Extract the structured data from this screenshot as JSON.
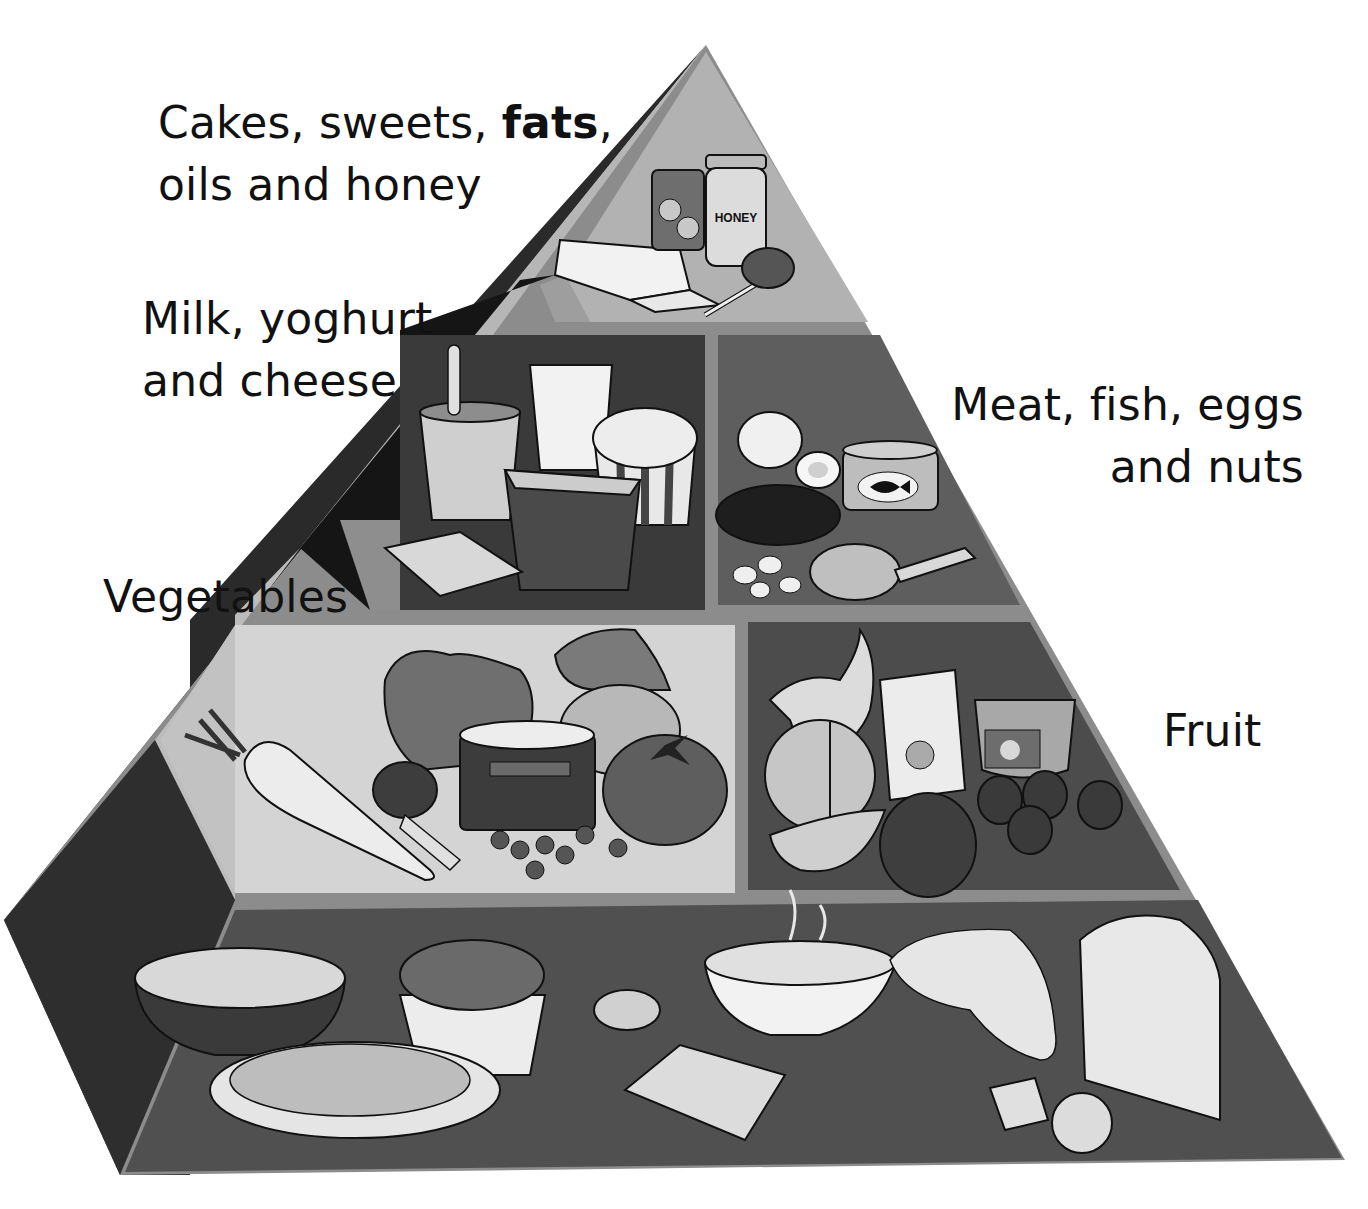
{
  "labels": {
    "top": {
      "line1_prefix": "Cakes, sweets, ",
      "line1_bold": "fats",
      "line1_suffix": ",",
      "line2": "oils and honey"
    },
    "dairy": {
      "line1": "Milk, yoghurt",
      "line2": "and cheese"
    },
    "protein": {
      "line1": "Meat, fish, eggs",
      "line2": "and nuts"
    },
    "vegetables": "Vegetables",
    "fruit": "Fruit"
  },
  "tiers": [
    {
      "name": "Cakes, sweets, fats, oils and honey",
      "items": [
        "butter",
        "canned fruit",
        "honey jar",
        "lollipop"
      ]
    },
    {
      "name": "Milk, yoghurt and cheese",
      "items": [
        "yoghurt pot",
        "glass of milk",
        "ice cream tub",
        "yoghurt cup",
        "cheese slices"
      ]
    },
    {
      "name": "Meat, fish, eggs and nuts",
      "items": [
        "boiled eggs",
        "fish tin",
        "burger",
        "nuts",
        "chicken leg"
      ]
    },
    {
      "name": "Vegetables",
      "items": [
        "carrot",
        "lettuce",
        "potato",
        "broccoli",
        "can of peas",
        "tomato"
      ]
    },
    {
      "name": "Fruit",
      "items": [
        "banana",
        "orange",
        "juice carton",
        "fruit cup",
        "melon slice",
        "apple",
        "strawberries"
      ]
    },
    {
      "name": "Bread and cereals",
      "items": [
        "cereal bowl",
        "rice cup",
        "spaghetti plate",
        "rice cake",
        "porridge bowl",
        "pitta bread",
        "cracker",
        "bread slice",
        "biscuits"
      ]
    }
  ],
  "product_text": {
    "honey_label": "HONEY"
  },
  "colors": {
    "outer_light": "#a8a8a8",
    "outer_dark": "#262626",
    "top_panel": "#b4b4b4",
    "dairy_panel": "#3c3c3c",
    "meat_panel": "#5e5e5e",
    "veg_panel": "#d6d6d6",
    "fruit_panel": "#4e4e4e",
    "base_panel": "#525252",
    "separator": "#8a8a8a"
  }
}
